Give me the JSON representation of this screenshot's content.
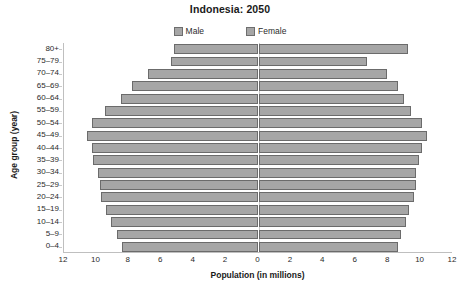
{
  "chart_data": {
    "type": "bar",
    "subtype": "population-pyramid",
    "title": "Indonesia: 2050",
    "xlabel": "Population (in millions)",
    "ylabel": "Age group (year)",
    "orientation": "horizontal",
    "grid": false,
    "legend_position": "top-center",
    "categories": [
      "80+",
      "75–79",
      "70–74",
      "65–69",
      "60–64",
      "55–59",
      "50–54",
      "45–49",
      "40–44",
      "35–39",
      "30–34",
      "25–29",
      "20–24",
      "15–19",
      "10–14",
      "5–9",
      "0–4"
    ],
    "series": [
      {
        "name": "Male",
        "side": "left",
        "color": "#a6a6a6",
        "values": [
          5.2,
          5.4,
          6.8,
          7.8,
          8.5,
          9.5,
          10.3,
          10.6,
          10.3,
          10.2,
          9.9,
          9.8,
          9.7,
          9.4,
          9.1,
          8.7,
          8.4
        ]
      },
      {
        "name": "Female",
        "side": "right",
        "color": "#a6a6a6",
        "values": [
          9.2,
          6.7,
          7.9,
          8.6,
          9.0,
          9.4,
          10.1,
          10.4,
          10.1,
          9.9,
          9.7,
          9.7,
          9.6,
          9.3,
          9.1,
          8.8,
          8.6
        ]
      }
    ],
    "xlim": [
      -12,
      12
    ],
    "xticks": [
      12,
      10,
      8,
      6,
      4,
      2,
      0,
      2,
      4,
      6,
      8,
      10,
      12
    ],
    "xtick_values": [
      -12,
      -10,
      -8,
      -6,
      -4,
      -2,
      0,
      2,
      4,
      6,
      8,
      10,
      12
    ]
  },
  "legend": {
    "items": [
      {
        "label": "Male"
      },
      {
        "label": "Female"
      }
    ]
  }
}
